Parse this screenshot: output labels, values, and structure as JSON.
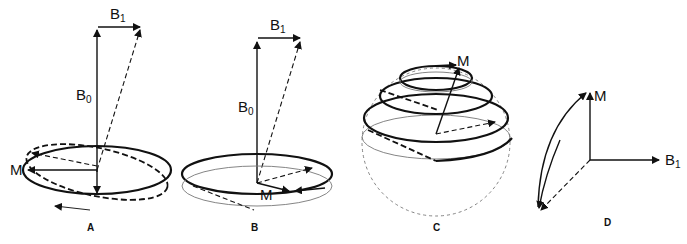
{
  "figure": {
    "panels": [
      {
        "id": "A",
        "label": "A",
        "vectors": {
          "b0": "B",
          "b0_sub": "0",
          "b1": "B",
          "b1_sub": "1",
          "m": "M"
        }
      },
      {
        "id": "B",
        "label": "B",
        "vectors": {
          "b0": "B",
          "b0_sub": "0",
          "b1": "B",
          "b1_sub": "1",
          "m": "M"
        }
      },
      {
        "id": "C",
        "label": "C",
        "vectors": {
          "m": "M"
        }
      },
      {
        "id": "D",
        "label": "D",
        "vectors": {
          "m": "M",
          "b1": "B",
          "b1_sub": "1"
        }
      }
    ]
  },
  "colors": {
    "ink": "#111111",
    "grey": "#777777",
    "background": "#ffffff"
  }
}
